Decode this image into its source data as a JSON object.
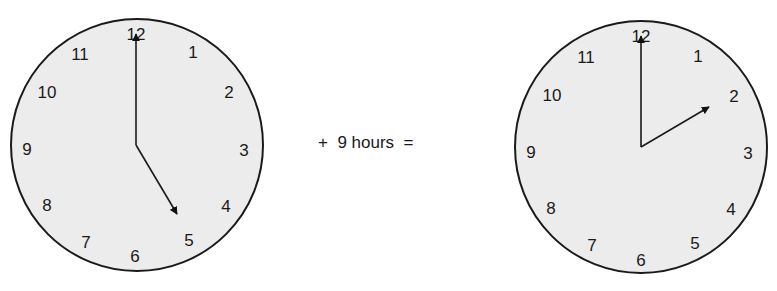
{
  "equation": {
    "plus": "+",
    "amount": "9 hours",
    "equals": "="
  },
  "clocks": [
    {
      "id": "start-clock",
      "time": "5:00",
      "numerals": [
        "12",
        "1",
        "2",
        "3",
        "4",
        "5",
        "6",
        "7",
        "8",
        "9",
        "10",
        "11"
      ]
    },
    {
      "id": "result-clock",
      "time": "2:00",
      "numerals": [
        "12",
        "1",
        "2",
        "3",
        "4",
        "5",
        "6",
        "7",
        "8",
        "9",
        "10",
        "11"
      ]
    }
  ],
  "colors": {
    "face": "#ececec",
    "outline": "#1a1a1a"
  }
}
